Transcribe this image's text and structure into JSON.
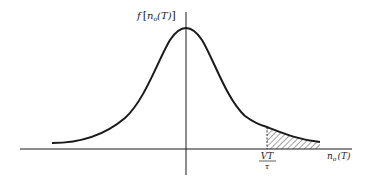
{
  "figure": {
    "type": "probability-density-curve",
    "y_axis_label": {
      "func": "f",
      "open": "[",
      "var": "n",
      "sub": "o",
      "arg": "(T)",
      "close": "]"
    },
    "x_axis_label": {
      "var": "n",
      "sub": "o",
      "arg": "(T)"
    },
    "threshold_label": {
      "numerator": "VT",
      "denominator": "τ"
    },
    "shaded_region": "tail beyond threshold VT/τ",
    "colors": {
      "line": "#1a1a1a",
      "background": "#ffffff"
    }
  }
}
